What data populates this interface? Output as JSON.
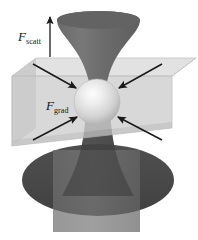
{
  "figure": {
    "name": "optical-tweezers-diagram",
    "caption": "",
    "background": "#ffffff",
    "width": 198,
    "height": 240
  },
  "labels": {
    "scattering_force": {
      "symbol": "F",
      "subscript": "scatt"
    },
    "gradient_force": {
      "symbol": "F",
      "subscript": "grad"
    }
  },
  "colors": {
    "beam_upper": "#6e6e6e",
    "beam_lower": "#585858",
    "beam_column": "#6a6a6a",
    "disk_dark": "#4a4a4a",
    "slab_top": "#d8d8d8",
    "slab_front": "#c9c9c9",
    "slab_left": "#bdbdbd",
    "slab_edge": "#a8a8a8",
    "sphere_light": "#f2f2f2",
    "sphere_mid": "#cfcfcf",
    "sphere_dark": "#9a9a9a",
    "arrow": "#1a1a1a",
    "label_text": "#141414"
  },
  "elements": {
    "upper_cone": "converging-laser-beam-cone",
    "lower_cone": "diverging-laser-beam-cone",
    "trapped_sphere": "dielectric-microsphere",
    "slab": "transparent-sample-slab",
    "bottom_disk": "objective-lens-disk",
    "bottom_column": "beam-column"
  },
  "arrows": {
    "scatt_vertical": {
      "direction": "up",
      "x": 50,
      "y1": 57,
      "y2": 16
    },
    "grad": [
      {
        "name": "arrow-upper-left",
        "x1": 33,
        "y1": 66,
        "x2": 74,
        "y2": 88
      },
      {
        "name": "arrow-upper-right",
        "x1": 160,
        "y1": 66,
        "x2": 120,
        "y2": 88
      },
      {
        "name": "arrow-lower-left",
        "x1": 33,
        "y1": 138,
        "x2": 76,
        "y2": 116
      },
      {
        "name": "arrow-lower-right",
        "x1": 160,
        "y1": 138,
        "x2": 120,
        "y2": 116
      }
    ]
  }
}
